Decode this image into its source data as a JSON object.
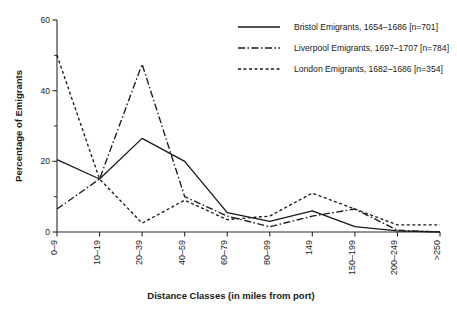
{
  "chart_data": {
    "type": "line",
    "title": "",
    "xlabel": "Distance Classes (in miles from port)",
    "ylabel": "Percentage of Emigrants",
    "categories": [
      "0–9",
      "10–19",
      "20–39",
      "40–59",
      "60–79",
      "80–99",
      "149",
      "150–199",
      "200–249",
      ">250"
    ],
    "ylim": [
      0,
      60
    ],
    "yticks": [
      0,
      20,
      40,
      60
    ],
    "yticks_minor": [
      10,
      30,
      50
    ],
    "grid": false,
    "legend_position": "top-right",
    "series": [
      {
        "name": "Bristol Emigrants, 1654–1686 [n=701]",
        "style": "solid",
        "values": [
          20.5,
          15.0,
          26.5,
          20.0,
          5.5,
          3.0,
          6.0,
          1.5,
          0.3,
          0.0
        ]
      },
      {
        "name": "Liverpool Emigrants, 1697–1707 [n=784]",
        "style": "dash-dot",
        "values": [
          6.5,
          15.0,
          47.5,
          10.0,
          4.5,
          1.5,
          4.5,
          6.5,
          0.5,
          0.0
        ]
      },
      {
        "name": "London Emigrants, 1682–1686 [n=354]",
        "style": "dashed",
        "values": [
          50.0,
          15.0,
          2.5,
          9.0,
          3.5,
          4.5,
          11.0,
          6.5,
          2.0,
          2.0
        ]
      }
    ]
  },
  "legend": {
    "items": [
      {
        "label": "Bristol Emigrants, 1654–1686 [n=701]"
      },
      {
        "label": "Liverpool Emigrants, 1697–1707 [n=784]"
      },
      {
        "label": "London Emigrants, 1682–1686 [n=354]"
      }
    ]
  },
  "axes": {
    "y_title": "Percentage of Emigrants",
    "x_title": "Distance Classes (in miles from port)",
    "y_tick_labels": [
      "0",
      "20",
      "40",
      "60"
    ],
    "x_tick_labels": [
      "0–9",
      "10–19",
      "20–39",
      "40–59",
      "60–79",
      "80–99",
      "149",
      "150–199",
      "200–249",
      ">250"
    ]
  },
  "colors": {
    "ink": "#1a1a1a",
    "axis": "#2a2a2a",
    "background": "#ffffff"
  }
}
